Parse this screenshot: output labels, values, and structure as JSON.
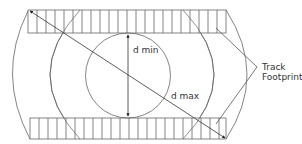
{
  "diagram": {
    "labels": {
      "d_min": "d min",
      "d_max": "d max",
      "track_footprint_line1": "Track",
      "track_footprint_line2": "Footprint"
    },
    "colors": {
      "line": "#555555",
      "background": "#ffffff",
      "text": "#333333"
    }
  }
}
